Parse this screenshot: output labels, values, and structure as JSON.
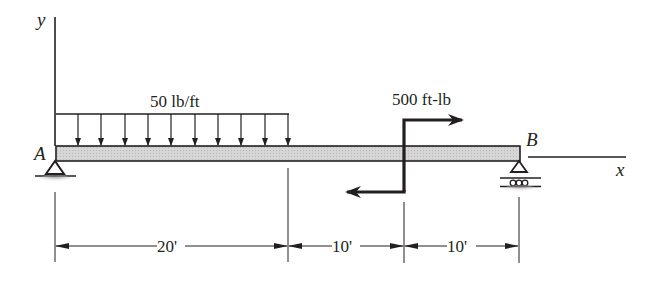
{
  "diagram": {
    "type": "beam-free-body",
    "axes": {
      "y_label": "y",
      "x_label": "x"
    },
    "points": {
      "A": "A",
      "B": "B"
    },
    "distributed_load": {
      "label": "50 lb/ft",
      "magnitude": 50,
      "units": "lb/ft",
      "span_ft": 20
    },
    "couple": {
      "label": "500 ft-lb",
      "magnitude": 500,
      "units": "ft-lb",
      "position_ft": 30
    },
    "supports": {
      "A": "pin",
      "B": "roller"
    },
    "dimensions": [
      {
        "label": "20'",
        "value_ft": 20
      },
      {
        "label": "10'",
        "value_ft": 10
      },
      {
        "label": "10'",
        "value_ft": 10
      }
    ],
    "colors": {
      "ink": "#231f20",
      "beam_fill": "#d0d0d0"
    }
  }
}
